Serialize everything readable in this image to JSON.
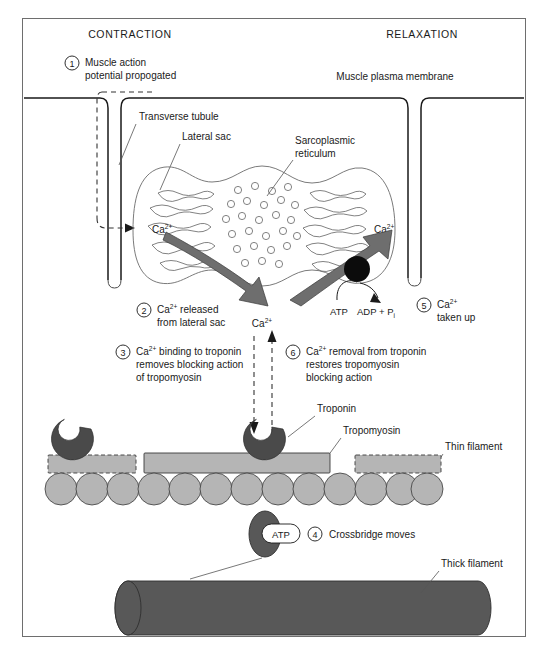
{
  "figure": {
    "title_left": "CONTRACTION",
    "title_right": "RELAXATION"
  },
  "steps": [
    {
      "num": "1",
      "lines": [
        "Muscle action",
        "potential propogated"
      ]
    },
    {
      "num": "2",
      "lines": [
        "Ca2+ released",
        "from lateral sac"
      ]
    },
    {
      "num": "3",
      "lines": [
        "Ca2+ binding to troponin",
        "removes blocking action",
        "of tropomyosin"
      ]
    },
    {
      "num": "4",
      "lines": [
        "Crossbridge moves"
      ]
    },
    {
      "num": "5",
      "lines": [
        "Ca2+",
        "taken up"
      ]
    },
    {
      "num": "6",
      "lines": [
        "Ca2+ removal from troponin",
        "restores tropomyosin",
        "blocking action"
      ]
    }
  ],
  "step1": {
    "num": "1",
    "line1": "Muscle action",
    "line2": "potential propogated"
  },
  "step2": {
    "num": "2",
    "line1_pre": "Ca",
    "line1_sup": "2+",
    "line1_post": " released",
    "line2": "from lateral sac"
  },
  "step3": {
    "num": "3",
    "line1_pre": "Ca",
    "line1_sup": "2+",
    "line1_post": " binding to troponin",
    "line2": "removes blocking action",
    "line3": "of tropomyosin"
  },
  "step4": {
    "num": "4",
    "line1": "Crossbridge moves"
  },
  "step5": {
    "num": "5",
    "line1_pre": "Ca",
    "line1_sup": "2+",
    "line2": "taken up"
  },
  "step6": {
    "num": "6",
    "line1_pre": "Ca",
    "line1_sup": "2+",
    "line1_post": " removal from troponin",
    "line2": "restores tropomyosin",
    "line3": "blocking action"
  },
  "labels": {
    "muscle_plasma_membrane": "Muscle plasma membrane",
    "transverse_tubule": "Transverse tubule",
    "lateral_sac": "Lateral sac",
    "sarcoplasmic": "Sarcoplasmic",
    "reticulum": "reticulum",
    "troponin": "Troponin",
    "tropomyosin": "Tropomyosin",
    "thin_filament": "Thin filament",
    "thick_filament": "Thick filament",
    "atp": "ATP",
    "adp": "ADP + P",
    "adp_sub": "i",
    "ca_base": "Ca",
    "ca_sup": "2+"
  },
  "ion_labels": {
    "lateral_sac_ca": "Ca",
    "right_sac_ca": "Ca",
    "cytosol_ca": "Ca",
    "filament_ca": "Ca",
    "sup": "2+"
  },
  "colors": {
    "frame": "#6e6e6e",
    "membrane": "#1a1a1a",
    "sr_outline": "#6b6b6b",
    "big_arrow": "#6e6e6e",
    "pump": "#0c0c0c",
    "actin": "#b5b5b5",
    "tropomyosin": "#b5b5b5",
    "troponin": "#4a4a4a",
    "thick_filament": "#585858",
    "text": "#1a1a1a",
    "background": "#ffffff"
  }
}
